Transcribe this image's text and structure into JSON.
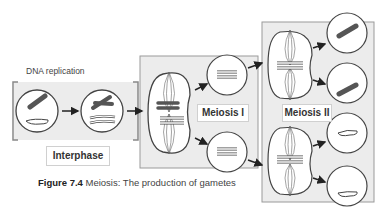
{
  "diagram": {
    "top_label": "DNA replication",
    "stages": [
      {
        "id": "interphase",
        "label": "Interphase"
      },
      {
        "id": "meiosis1",
        "label": "Meiosis I"
      },
      {
        "id": "meiosis2",
        "label": "Meiosis II"
      }
    ],
    "caption": {
      "figure_label": "Figure 7.4",
      "text": " Meiosis: The production of gametes"
    },
    "colors": {
      "panel": "#ececec",
      "panel_border": "#9a9a9a",
      "chromosome_dark": "#555555",
      "chromosome_light": "#ffffff",
      "outline": "#444444"
    }
  }
}
